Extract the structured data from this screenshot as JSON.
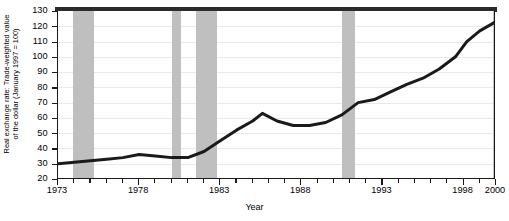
{
  "chart_data": {
    "type": "line",
    "title": "",
    "xlabel": "Year",
    "ylabel": "Real exchange rate: Trade-weighted value of the dollar (January 1997 = 100)",
    "ylabel_line1": "Real exchange rate: Trade-weighted value",
    "ylabel_line2": "of the dollar (January 1997 = 100)",
    "xlim": [
      1973,
      2000
    ],
    "ylim": [
      20,
      130
    ],
    "yticks": [
      130,
      120,
      110,
      100,
      90,
      80,
      70,
      60,
      50,
      40,
      30,
      20
    ],
    "ytick_labels": [
      "130",
      "120",
      "110",
      "100",
      "90",
      "80",
      "70",
      "60",
      "50",
      "40",
      "30",
      "20"
    ],
    "xticks": [
      1973,
      1974,
      1975,
      1976,
      1977,
      1978,
      1979,
      1980,
      1981,
      1982,
      1983,
      1984,
      1985,
      1986,
      1987,
      1988,
      1989,
      1990,
      1991,
      1992,
      1993,
      1994,
      1995,
      1996,
      1997,
      1998,
      1999,
      2000
    ],
    "xtick_labels": [
      "1973",
      "1978",
      "1983",
      "1988",
      "1993",
      "1998",
      "2000"
    ],
    "xtick_label_values": [
      1973,
      1978,
      1983,
      1988,
      1993,
      1998,
      2000
    ],
    "grid": "horizontal",
    "legend": "none",
    "line_color": "#1a1a1a",
    "line_width": 3,
    "shading_color": "#bfbfbf",
    "shading_label": "recession bands",
    "recession_bands": [
      {
        "start": 1973.9,
        "end": 1975.2
      },
      {
        "start": 1980.0,
        "end": 1980.6
      },
      {
        "start": 1981.5,
        "end": 1982.8
      },
      {
        "start": 1990.5,
        "end": 1991.3
      },
      {
        "start": 1999.8,
        "end": 2000.0
      }
    ],
    "x": [
      1973.0,
      1974.0,
      1975.0,
      1976.0,
      1977.0,
      1978.0,
      1979.0,
      1980.0,
      1981.0,
      1982.0,
      1983.0,
      1984.0,
      1985.0,
      1985.6,
      1986.5,
      1987.5,
      1988.5,
      1989.5,
      1990.5,
      1991.5,
      1992.5,
      1993.5,
      1994.5,
      1995.5,
      1996.5,
      1997.5,
      1998.2,
      1999.0,
      2000.0
    ],
    "values": [
      30,
      31,
      32,
      33,
      34,
      36,
      35,
      34,
      34,
      38,
      45,
      52,
      58,
      63,
      58,
      55,
      55,
      57,
      62,
      70,
      72,
      77,
      82,
      86,
      92,
      100,
      110,
      117,
      123
    ],
    "series": [
      {
        "name": "Real exchange rate",
        "values": [
          30,
          31,
          32,
          33,
          34,
          36,
          35,
          34,
          34,
          38,
          45,
          52,
          58,
          63,
          58,
          55,
          55,
          57,
          62,
          70,
          72,
          77,
          82,
          86,
          92,
          100,
          110,
          117,
          123
        ]
      }
    ]
  }
}
